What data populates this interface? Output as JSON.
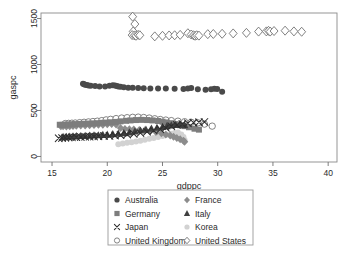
{
  "chart_data": {
    "type": "scatter",
    "title": "",
    "xlabel": "gdppc",
    "ylabel": "gaspc",
    "xlim": [
      14.0,
      40.8
    ],
    "ylim": [
      -60,
      1560
    ],
    "xticks": [
      15,
      20,
      25,
      30,
      35,
      40
    ],
    "yticks": [
      0,
      500,
      1000,
      1500
    ],
    "xticklabels": [
      "15",
      "20",
      "25",
      "30",
      "35",
      "40"
    ],
    "yticklabels": [
      "0",
      "500",
      "1000",
      "1500"
    ],
    "grid": false,
    "legend_position": "below-axes",
    "legend_columns": 2,
    "series": [
      {
        "name": "Australia",
        "marker": "filled-circle",
        "color": "#4a4a4a",
        "size": 3.0,
        "points": [
          [
            17.8,
            790
          ],
          [
            17.9,
            786
          ],
          [
            18.0,
            780
          ],
          [
            18.15,
            776
          ],
          [
            18.3,
            772
          ],
          [
            18.5,
            768
          ],
          [
            18.9,
            765
          ],
          [
            19.3,
            762
          ],
          [
            19.8,
            760
          ],
          [
            20.2,
            768
          ],
          [
            20.5,
            775
          ],
          [
            20.7,
            772
          ],
          [
            20.85,
            765
          ],
          [
            21.0,
            762
          ],
          [
            21.2,
            758
          ],
          [
            21.5,
            752
          ],
          [
            21.9,
            748
          ],
          [
            22.3,
            746
          ],
          [
            22.8,
            744
          ],
          [
            23.3,
            742
          ],
          [
            23.9,
            740
          ],
          [
            24.6,
            740
          ],
          [
            25.3,
            738
          ],
          [
            26.1,
            736
          ],
          [
            26.9,
            734
          ],
          [
            27.3,
            740
          ],
          [
            27.6,
            745
          ],
          [
            28.2,
            730
          ],
          [
            28.9,
            726
          ],
          [
            29.4,
            732
          ],
          [
            29.7,
            736
          ],
          [
            29.95,
            734
          ],
          [
            30.4,
            705
          ]
        ]
      },
      {
        "name": "France",
        "marker": "filled-diamond",
        "color": "#8c8c8c",
        "size": 3.2,
        "points": [
          [
            15.8,
            330
          ],
          [
            16.0,
            328
          ],
          [
            16.3,
            326
          ],
          [
            16.6,
            330
          ],
          [
            16.9,
            332
          ],
          [
            17.2,
            334
          ],
          [
            17.6,
            336
          ],
          [
            18.0,
            338
          ],
          [
            18.4,
            340
          ],
          [
            18.8,
            342
          ],
          [
            19.2,
            344
          ],
          [
            19.6,
            346
          ],
          [
            20.0,
            350
          ],
          [
            20.4,
            352
          ],
          [
            20.8,
            348
          ],
          [
            21.2,
            310
          ],
          [
            21.6,
            300
          ],
          [
            22.0,
            296
          ],
          [
            22.4,
            292
          ],
          [
            22.9,
            288
          ],
          [
            23.4,
            284
          ],
          [
            23.9,
            276
          ],
          [
            24.4,
            266
          ],
          [
            24.9,
            252
          ],
          [
            25.3,
            240
          ],
          [
            25.7,
            228
          ],
          [
            26.0,
            214
          ],
          [
            26.3,
            200
          ],
          [
            26.6,
            188
          ],
          [
            26.9,
            172
          ],
          [
            27.0,
            160
          ]
        ]
      },
      {
        "name": "Germany",
        "marker": "filled-square",
        "color": "#7d7d7d",
        "size": 3.0,
        "points": [
          [
            15.7,
            345
          ],
          [
            15.95,
            344
          ],
          [
            16.2,
            346
          ],
          [
            16.5,
            348
          ],
          [
            16.8,
            350
          ],
          [
            17.1,
            352
          ],
          [
            17.5,
            354
          ],
          [
            17.9,
            356
          ],
          [
            18.3,
            358
          ],
          [
            18.7,
            360
          ],
          [
            19.1,
            362
          ],
          [
            19.5,
            366
          ],
          [
            19.9,
            368
          ],
          [
            20.3,
            372
          ],
          [
            20.7,
            376
          ],
          [
            21.2,
            382
          ],
          [
            21.7,
            388
          ],
          [
            22.1,
            392
          ],
          [
            22.6,
            396
          ],
          [
            23.1,
            398
          ],
          [
            23.6,
            396
          ],
          [
            24.1,
            392
          ],
          [
            24.6,
            386
          ],
          [
            25.0,
            378
          ],
          [
            25.4,
            370
          ],
          [
            25.8,
            362
          ],
          [
            26.2,
            352
          ],
          [
            26.6,
            340
          ],
          [
            27.0,
            330
          ],
          [
            27.4,
            318
          ],
          [
            27.9,
            302
          ],
          [
            28.3,
            292
          ]
        ]
      },
      {
        "name": "Italy",
        "marker": "filled-triangle",
        "color": "#3f3f3f",
        "size": 3.2,
        "points": [
          [
            16.0,
            212
          ],
          [
            16.3,
            214
          ],
          [
            16.6,
            216
          ],
          [
            16.9,
            218
          ],
          [
            17.2,
            220
          ],
          [
            17.6,
            222
          ],
          [
            18.0,
            224
          ],
          [
            18.4,
            226
          ],
          [
            18.8,
            228
          ],
          [
            19.2,
            230
          ],
          [
            19.6,
            234
          ],
          [
            20.0,
            238
          ],
          [
            20.5,
            242
          ],
          [
            21.0,
            248
          ],
          [
            21.5,
            254
          ],
          [
            22.0,
            262
          ],
          [
            22.5,
            272
          ],
          [
            23.0,
            282
          ],
          [
            23.5,
            292
          ],
          [
            24.0,
            302
          ],
          [
            24.5,
            312
          ],
          [
            25.0,
            322
          ],
          [
            25.4,
            330
          ],
          [
            25.8,
            338
          ],
          [
            26.2,
            344
          ],
          [
            26.6,
            346
          ],
          [
            27.0,
            340
          ]
        ]
      },
      {
        "name": "Japan",
        "marker": "cross-x",
        "color": "#2e2e2e",
        "size": 3.4,
        "points": [
          [
            15.6,
            198
          ],
          [
            15.9,
            200
          ],
          [
            16.2,
            204
          ],
          [
            16.5,
            206
          ],
          [
            16.8,
            208
          ],
          [
            17.2,
            210
          ],
          [
            17.6,
            212
          ],
          [
            18.0,
            214
          ],
          [
            18.4,
            216
          ],
          [
            18.8,
            218
          ],
          [
            19.2,
            220
          ],
          [
            19.7,
            222
          ],
          [
            20.2,
            224
          ],
          [
            20.7,
            228
          ],
          [
            21.2,
            232
          ],
          [
            21.8,
            238
          ],
          [
            22.4,
            246
          ],
          [
            23.0,
            256
          ],
          [
            23.6,
            268
          ],
          [
            24.2,
            282
          ],
          [
            24.8,
            296
          ],
          [
            25.3,
            312
          ],
          [
            25.8,
            328
          ],
          [
            26.3,
            342
          ],
          [
            26.8,
            354
          ],
          [
            27.3,
            362
          ],
          [
            27.8,
            368
          ],
          [
            28.3,
            372
          ],
          [
            28.8,
            376
          ]
        ]
      },
      {
        "name": "Korea",
        "marker": "filled-circle-light",
        "color": "#d2d2d2",
        "size": 3.0,
        "points": [
          [
            21.0,
            134
          ],
          [
            21.4,
            140
          ],
          [
            21.8,
            148
          ],
          [
            22.2,
            156
          ],
          [
            22.6,
            164
          ],
          [
            23.0,
            172
          ],
          [
            23.4,
            182
          ],
          [
            23.8,
            192
          ],
          [
            24.2,
            202
          ],
          [
            24.6,
            212
          ],
          [
            25.0,
            224
          ],
          [
            25.4,
            236
          ],
          [
            25.8,
            248
          ],
          [
            26.1,
            256
          ],
          [
            26.4,
            262
          ],
          [
            26.7,
            240
          ],
          [
            26.9,
            212
          ],
          [
            27.0,
            178
          ]
        ]
      },
      {
        "name": "United Kingdom",
        "marker": "open-circle",
        "color": "#6e6e6e",
        "size": 3.2,
        "points": [
          [
            16.2,
            358
          ],
          [
            16.5,
            360
          ],
          [
            16.8,
            362
          ],
          [
            17.1,
            364
          ],
          [
            17.5,
            368
          ],
          [
            17.9,
            372
          ],
          [
            18.3,
            376
          ],
          [
            18.7,
            380
          ],
          [
            19.1,
            384
          ],
          [
            19.5,
            390
          ],
          [
            19.9,
            398
          ],
          [
            20.3,
            404
          ],
          [
            20.8,
            412
          ],
          [
            21.3,
            418
          ],
          [
            21.8,
            422
          ],
          [
            22.3,
            426
          ],
          [
            22.8,
            428
          ],
          [
            23.3,
            424
          ],
          [
            23.8,
            418
          ],
          [
            24.3,
            410
          ],
          [
            24.8,
            402
          ],
          [
            25.3,
            396
          ],
          [
            25.8,
            390
          ],
          [
            26.4,
            384
          ],
          [
            27.0,
            378
          ],
          [
            27.6,
            372
          ],
          [
            28.2,
            366
          ],
          [
            28.8,
            352
          ],
          [
            29.5,
            330
          ]
        ]
      },
      {
        "name": "United States",
        "marker": "open-diamond",
        "color": "#6a6a6a",
        "size": 3.6,
        "points": [
          [
            22.3,
            1520
          ],
          [
            22.5,
            1440
          ],
          [
            22.35,
            1360
          ],
          [
            22.25,
            1320
          ],
          [
            22.45,
            1316
          ],
          [
            22.6,
            1312
          ],
          [
            22.8,
            1322
          ],
          [
            22.95,
            1318
          ],
          [
            24.3,
            1306
          ],
          [
            25.0,
            1312
          ],
          [
            25.6,
            1316
          ],
          [
            26.1,
            1318
          ],
          [
            26.6,
            1322
          ],
          [
            27.3,
            1340
          ],
          [
            27.6,
            1326
          ],
          [
            27.8,
            1318
          ],
          [
            27.95,
            1312
          ],
          [
            28.1,
            1318
          ],
          [
            28.3,
            1314
          ],
          [
            29.1,
            1330
          ],
          [
            29.6,
            1332
          ],
          [
            30.4,
            1334
          ],
          [
            31.4,
            1338
          ],
          [
            32.6,
            1344
          ],
          [
            33.7,
            1358
          ],
          [
            34.4,
            1360
          ],
          [
            34.6,
            1366
          ],
          [
            34.75,
            1358
          ],
          [
            35.1,
            1364
          ],
          [
            36.1,
            1368
          ],
          [
            36.9,
            1360
          ],
          [
            37.6,
            1356
          ]
        ]
      }
    ]
  },
  "legend": {
    "items": [
      {
        "label": "Australia",
        "marker": "filled-circle",
        "color": "#4a4a4a"
      },
      {
        "label": "France",
        "marker": "filled-diamond",
        "color": "#8c8c8c"
      },
      {
        "label": "Germany",
        "marker": "filled-square",
        "color": "#7d7d7d"
      },
      {
        "label": "Italy",
        "marker": "filled-triangle",
        "color": "#3f3f3f"
      },
      {
        "label": "Japan",
        "marker": "cross-x",
        "color": "#2e2e2e"
      },
      {
        "label": "Korea",
        "marker": "filled-circle-light",
        "color": "#d2d2d2"
      },
      {
        "label": "United Kingdom",
        "marker": "open-circle",
        "color": "#6e6e6e"
      },
      {
        "label": "United States",
        "marker": "open-diamond",
        "color": "#6a6a6a"
      }
    ]
  },
  "style": {
    "background": "#ffffff",
    "frame_color": "#8a8a8a",
    "tick_color": "#6f6f6f",
    "text_color": "#2b2b2b",
    "legend_border": "#9a9a9a"
  }
}
